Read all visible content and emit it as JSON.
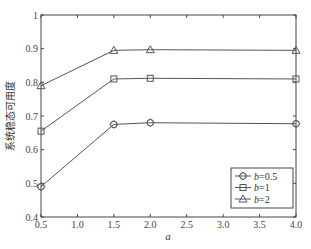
{
  "chart_data": {
    "type": "line",
    "title": "",
    "xlabel": "a",
    "ylabel": "系统稳态可用度",
    "xlim": [
      0.5,
      4.0
    ],
    "ylim": [
      0.4,
      1.0
    ],
    "x_ticks": [
      "0.5",
      "1.0",
      "1.5",
      "2.0",
      "2.5",
      "3.0",
      "3.5",
      "4.0"
    ],
    "y_ticks": [
      "0.4",
      "0.5",
      "0.6",
      "0.7",
      "0.8",
      "0.9",
      "1"
    ],
    "grid": false,
    "legend_position": "lower right",
    "x": [
      0.5,
      1.5,
      2.0,
      4.0
    ],
    "series": [
      {
        "name": "b=0.5",
        "label_var": "b",
        "label_val": "=0.5",
        "marker": "diamond-circle",
        "values": [
          0.49,
          0.675,
          0.68,
          0.677
        ]
      },
      {
        "name": "b=1",
        "label_var": "b",
        "label_val": "=1",
        "marker": "square",
        "values": [
          0.655,
          0.81,
          0.812,
          0.81
        ]
      },
      {
        "name": "b=2",
        "label_var": "b",
        "label_val": "=2",
        "marker": "triangle",
        "values": [
          0.79,
          0.895,
          0.897,
          0.895
        ]
      }
    ],
    "colors": {
      "line": "#555555",
      "axis": "#444444",
      "background": "#ffffff"
    }
  }
}
